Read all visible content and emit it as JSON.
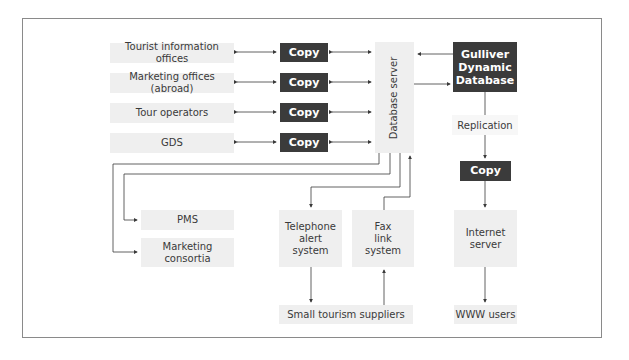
{
  "diagram": {
    "sources": [
      {
        "label": "Tourist information offices"
      },
      {
        "label": "Marketing offices (abroad)"
      },
      {
        "label": "Tour operators"
      },
      {
        "label": "GDS"
      }
    ],
    "copy_label": "Copy",
    "database_server": "Database server",
    "gulliver": {
      "line1": "Gulliver",
      "line2": "Dynamic",
      "line3": "Database"
    },
    "replication": "Replication",
    "pms": "PMS",
    "marketing_consortia": {
      "line1": "Marketing",
      "line2": "consortia"
    },
    "telephone": {
      "line1": "Telephone",
      "line2": "alert",
      "line3": "system"
    },
    "fax": {
      "line1": "Fax",
      "line2": "link",
      "line3": "system"
    },
    "internet_server": {
      "line1": "Internet",
      "line2": "server"
    },
    "small_suppliers": "Small tourism suppliers",
    "www_users": "WWW users"
  },
  "colors": {
    "dark_box": "#3b3b3b",
    "light_box": "#efefef",
    "line": "#3a3a3a",
    "frame": "#8a8a8a"
  }
}
